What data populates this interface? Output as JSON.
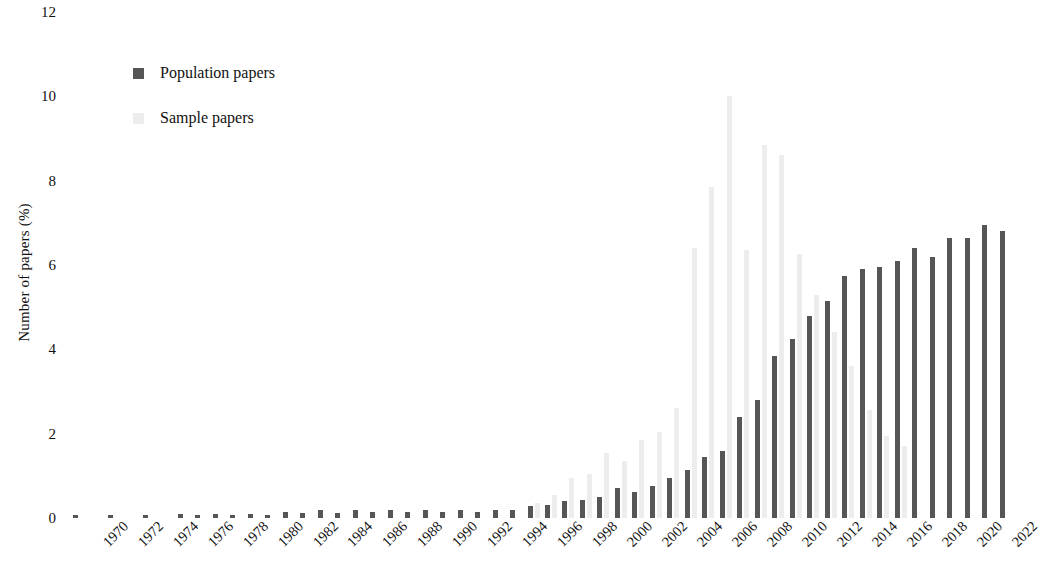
{
  "chart_data": {
    "type": "bar",
    "title": "",
    "subtitle": "",
    "xlabel": "",
    "ylabel": "Number of papers (%)",
    "ylim": [
      0,
      12
    ],
    "ytick_labels": [
      "0",
      "2",
      "4",
      "6",
      "8",
      "10",
      "12"
    ],
    "ytick_values": [
      0,
      2,
      4,
      6,
      8,
      10,
      12
    ],
    "grid": false,
    "legend_position": "upper-left",
    "xtick_labels": [
      "1970",
      "1972",
      "1974",
      "1976",
      "1978",
      "1980",
      "1982",
      "1984",
      "1986",
      "1988",
      "1990",
      "1992",
      "1994",
      "1996",
      "1998",
      "2000",
      "2002",
      "2004",
      "2006",
      "2008",
      "2010",
      "2012",
      "2014",
      "2016",
      "2018",
      "2020",
      "2022"
    ],
    "categories": [
      "1970",
      "1971",
      "1972",
      "1973",
      "1974",
      "1975",
      "1976",
      "1977",
      "1978",
      "1979",
      "1980",
      "1981",
      "1982",
      "1983",
      "1984",
      "1985",
      "1986",
      "1987",
      "1988",
      "1989",
      "1990",
      "1991",
      "1992",
      "1993",
      "1994",
      "1995",
      "1996",
      "1997",
      "1998",
      "1999",
      "2000",
      "2001",
      "2002",
      "2003",
      "2004",
      "2005",
      "2006",
      "2007",
      "2008",
      "2009",
      "2010",
      "2011",
      "2012",
      "2013",
      "2014",
      "2015",
      "2016",
      "2017",
      "2018",
      "2019",
      "2020",
      "2021",
      "2022",
      "2023"
    ],
    "series": [
      {
        "name": "Population papers",
        "color": "#565656",
        "values": [
          0.08,
          0.0,
          0.08,
          0.0,
          0.08,
          0.0,
          0.1,
          0.08,
          0.1,
          0.08,
          0.1,
          0.08,
          0.15,
          0.12,
          0.18,
          0.12,
          0.2,
          0.15,
          0.18,
          0.15,
          0.2,
          0.15,
          0.18,
          0.15,
          0.18,
          0.2,
          0.28,
          0.3,
          0.4,
          0.42,
          0.5,
          0.72,
          0.62,
          0.75,
          0.95,
          1.15,
          1.45,
          1.6,
          2.4,
          2.8,
          3.85,
          4.25,
          4.8,
          5.15,
          5.75,
          5.9,
          5.95,
          6.1,
          6.4,
          6.2,
          6.65,
          6.65,
          6.95,
          6.8
        ]
      },
      {
        "name": "Sample papers",
        "color": "#ededed",
        "values": [
          0.0,
          0.0,
          0.0,
          0.0,
          0.0,
          0.0,
          0.0,
          0.0,
          0.0,
          0.0,
          0.0,
          0.0,
          0.0,
          0.0,
          0.0,
          0.0,
          0.0,
          0.0,
          0.0,
          0.0,
          0.0,
          0.0,
          0.0,
          0.0,
          0.0,
          0.0,
          0.35,
          0.55,
          0.95,
          1.05,
          1.55,
          1.35,
          1.85,
          2.05,
          2.6,
          6.4,
          7.85,
          10.0,
          6.35,
          8.85,
          8.6,
          6.25,
          5.3,
          4.4,
          3.6,
          2.55,
          1.95,
          1.7,
          0.0,
          0.0,
          0.0,
          0.0,
          0.0,
          0.0
        ]
      }
    ]
  },
  "legend": {
    "items": [
      {
        "label": "Population papers",
        "color": "#565656"
      },
      {
        "label": "Sample papers",
        "color": "#ededed"
      }
    ]
  }
}
